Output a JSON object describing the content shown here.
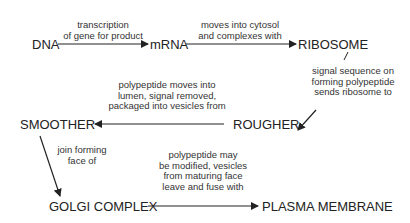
{
  "nodes": {
    "dna": "DNA",
    "mrna": "mRNA",
    "ribosome": "RIBOSOME",
    "rougher": "ROUGHER",
    "smoother": "SMOOTHER",
    "golgi": "GOLGI COMPLEX",
    "plasma": "PLASMA MEMBRANE"
  },
  "edges": {
    "dna_to_mrna": [
      "transcription",
      "of gene for product"
    ],
    "mrna_to_ribosome": [
      "moves into cytosol",
      "and complexes with"
    ],
    "ribosome_to_rougher": [
      "signal sequence on",
      "forming polypeptide",
      "sends ribosome to"
    ],
    "rougher_to_smoother": [
      "polypeptide moves into",
      "lumen, signal removed,",
      "packaged into vesicles from"
    ],
    "smoother_to_golgi": [
      "join forming",
      "face of"
    ],
    "golgi_to_plasma": [
      "polypeptide may",
      "be modified, vesicles",
      "from maturing face",
      "leave and fuse with"
    ]
  }
}
